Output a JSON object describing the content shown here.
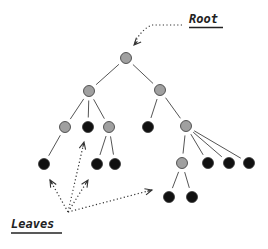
{
  "labels": {
    "root": "Root",
    "leaves": "Leaves"
  },
  "colors": {
    "internal_node": "#a0a0a0",
    "leaf_node": "#111111",
    "edge": "#555555",
    "arrow": "#333333",
    "background": "#ffffff"
  },
  "nodes": [
    {
      "id": "root",
      "type": "internal",
      "x": 126,
      "y": 58
    },
    {
      "id": "a",
      "type": "internal",
      "x": 89,
      "y": 91
    },
    {
      "id": "b",
      "type": "internal",
      "x": 160,
      "y": 90
    },
    {
      "id": "a1",
      "type": "internal",
      "x": 65,
      "y": 127
    },
    {
      "id": "a2",
      "type": "leaf",
      "x": 88,
      "y": 127
    },
    {
      "id": "a3",
      "type": "internal",
      "x": 109,
      "y": 127
    },
    {
      "id": "a1a",
      "type": "leaf",
      "x": 44,
      "y": 164
    },
    {
      "id": "a3a",
      "type": "leaf",
      "x": 97,
      "y": 164
    },
    {
      "id": "a3b",
      "type": "leaf",
      "x": 115,
      "y": 164
    },
    {
      "id": "b1",
      "type": "leaf",
      "x": 148,
      "y": 127
    },
    {
      "id": "b2",
      "type": "internal",
      "x": 186,
      "y": 126
    },
    {
      "id": "b2a",
      "type": "internal",
      "x": 182,
      "y": 163
    },
    {
      "id": "b2b",
      "type": "leaf",
      "x": 208,
      "y": 163
    },
    {
      "id": "b2c",
      "type": "leaf",
      "x": 229,
      "y": 163
    },
    {
      "id": "b2d",
      "type": "leaf",
      "x": 249,
      "y": 163
    },
    {
      "id": "b2a1",
      "type": "leaf",
      "x": 169,
      "y": 197
    },
    {
      "id": "b2a2",
      "type": "leaf",
      "x": 192,
      "y": 197
    }
  ],
  "edges": [
    [
      "root",
      "a"
    ],
    [
      "root",
      "b"
    ],
    [
      "a",
      "a1"
    ],
    [
      "a",
      "a2"
    ],
    [
      "a",
      "a3"
    ],
    [
      "a1",
      "a1a"
    ],
    [
      "a3",
      "a3a"
    ],
    [
      "a3",
      "a3b"
    ],
    [
      "b",
      "b1"
    ],
    [
      "b",
      "b2"
    ],
    [
      "b2",
      "b2a"
    ],
    [
      "b2",
      "b2b"
    ],
    [
      "b2",
      "b2c"
    ],
    [
      "b2",
      "b2d"
    ],
    [
      "b2a",
      "b2a1"
    ],
    [
      "b2a",
      "b2a2"
    ]
  ],
  "arrows": {
    "root": {
      "path": "M182,25 L152,25 Q140,30 134,45",
      "head": [
        134,
        45
      ],
      "from_dir": [
        148,
        30
      ]
    },
    "leaves": [
      {
        "from": [
          68,
          212
        ],
        "to": [
          50,
          180
        ]
      },
      {
        "from": [
          68,
          212
        ],
        "to": [
          84,
          142
        ]
      },
      {
        "from": [
          68,
          212
        ],
        "to": [
          88,
          180
        ]
      },
      {
        "from": [
          68,
          212
        ],
        "to": [
          152,
          190
        ]
      }
    ]
  }
}
